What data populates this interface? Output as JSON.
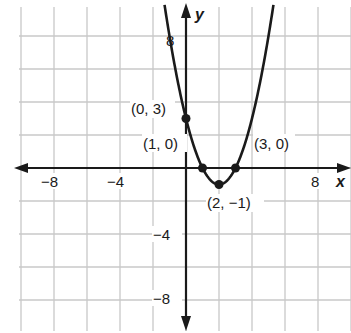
{
  "chart_data": {
    "type": "line",
    "title": "",
    "xlabel": "x",
    "ylabel": "y",
    "xlim": [
      -10,
      10
    ],
    "ylim": [
      -10,
      10
    ],
    "grid": true,
    "grid_step": 2,
    "x_ticks": [
      {
        "value": -8,
        "label": "−8"
      },
      {
        "value": -4,
        "label": "−4"
      },
      {
        "value": 8,
        "label": "8"
      }
    ],
    "y_ticks": [
      {
        "value": 8,
        "label": "8"
      },
      {
        "value": -4,
        "label": "−4"
      },
      {
        "value": -8,
        "label": "−8"
      }
    ],
    "series": [
      {
        "name": "y = x² − 4x + 3",
        "function": "(x-2)^2-1",
        "x_range": [
          -1.3,
          5.3
        ],
        "color": "#1a1a1a"
      }
    ],
    "points": [
      {
        "x": 0,
        "y": 3,
        "label": "(0, 3)"
      },
      {
        "x": 1,
        "y": 0,
        "label": "(1, 0)"
      },
      {
        "x": 3,
        "y": 0,
        "label": "(3, 0)"
      },
      {
        "x": 2,
        "y": -1,
        "label": "(2, −1)"
      }
    ]
  },
  "labels": {
    "x_axis": "x",
    "y_axis": "y",
    "tick_x_neg8": "−8",
    "tick_x_neg4": "−4",
    "tick_x_8": "8",
    "tick_y_8": "8",
    "tick_y_neg4": "−4",
    "tick_y_neg8": "−8",
    "pt_0_3": "(0, 3)",
    "pt_1_0": "(1, 0)",
    "pt_3_0": "(3, 0)",
    "pt_2_neg1": "(2, −1)"
  },
  "colors": {
    "grid": "#c8c8c8",
    "axis": "#1a1a1a",
    "curve": "#1a1a1a"
  }
}
